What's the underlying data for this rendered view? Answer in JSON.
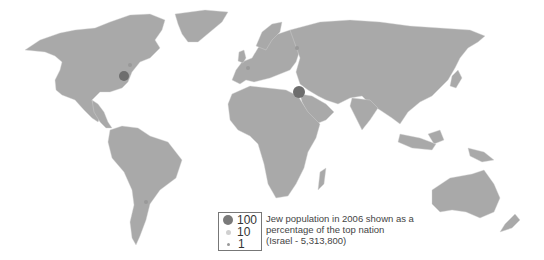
{
  "map": {
    "title": "Jew population in 2006 shown as a percentage of the top nation",
    "land_color": "#a9a9a9",
    "border_color": "#d6d6d6",
    "marker_color": "#6e6e6e",
    "markers": [
      {
        "name": "Israel",
        "cx": 299,
        "cy": 92,
        "r": 6,
        "value": 100
      },
      {
        "name": "United States",
        "cx": 124,
        "cy": 76,
        "r": 5,
        "value": 100
      }
    ]
  },
  "legend": {
    "items": [
      {
        "label": "100",
        "size": 10,
        "color": "#7a7a7a"
      },
      {
        "label": "10",
        "size": 5,
        "color": "#d0d0d0"
      },
      {
        "label": "1",
        "size": 3,
        "color": "#999999"
      }
    ],
    "line1": "Jew population in 2006 shown as a",
    "line2": "percentage of the top nation",
    "line3": "(Israel - 5,313,800)"
  }
}
